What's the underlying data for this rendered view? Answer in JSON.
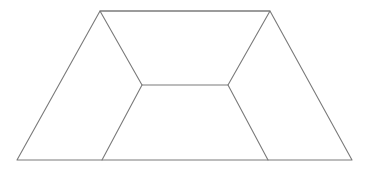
{
  "canvas": {
    "width": 367,
    "height": 171,
    "background_color": "#ffffff",
    "title": "Line drawing of a trapezoid partitioned into three regions"
  },
  "style": {
    "stroke_color": "#7a7a7a",
    "stroke_width": 1.1,
    "fill_color": "none"
  },
  "chart_data": {
    "type": "diagram",
    "grid": false,
    "legend": false,
    "xlim": [
      0,
      367
    ],
    "ylim": [
      0,
      171
    ],
    "points": {
      "outer_top_left": [
        100,
        11
      ],
      "outer_top_right": [
        270,
        11
      ],
      "outer_bottom_right": [
        352,
        160
      ],
      "outer_bottom_left": [
        17,
        160
      ],
      "inner_top_left": [
        142,
        85
      ],
      "inner_top_right": [
        228,
        85
      ],
      "inner_bottom_left": [
        102,
        160
      ],
      "inner_bottom_right": [
        268,
        160
      ]
    },
    "shapes": [
      {
        "name": "outer-trapezoid",
        "kind": "polygon",
        "closed": true,
        "vertices": [
          [
            100,
            11
          ],
          [
            270,
            11
          ],
          [
            352,
            160
          ],
          [
            17,
            160
          ]
        ]
      },
      {
        "name": "inner-trapezoid",
        "kind": "polygon",
        "closed": true,
        "vertices": [
          [
            100,
            11
          ],
          [
            270,
            11
          ],
          [
            228,
            85
          ],
          [
            142,
            85
          ]
        ]
      },
      {
        "name": "left-divider-segment",
        "kind": "line",
        "closed": false,
        "vertices": [
          [
            142,
            85
          ],
          [
            102,
            160
          ]
        ]
      },
      {
        "name": "right-divider-segment",
        "kind": "line",
        "closed": false,
        "vertices": [
          [
            228,
            85
          ],
          [
            268,
            160
          ]
        ]
      }
    ],
    "regions": [
      {
        "name": "left-region",
        "vertices": [
          [
            100,
            11
          ],
          [
            142,
            85
          ],
          [
            102,
            160
          ],
          [
            17,
            160
          ]
        ]
      },
      {
        "name": "center-region",
        "vertices": [
          [
            142,
            85
          ],
          [
            228,
            85
          ],
          [
            268,
            160
          ],
          [
            102,
            160
          ]
        ]
      },
      {
        "name": "right-region",
        "vertices": [
          [
            270,
            11
          ],
          [
            352,
            160
          ],
          [
            268,
            160
          ],
          [
            228,
            85
          ]
        ]
      }
    ],
    "edges": [
      {
        "name": "top-edge",
        "from": [
          100,
          11
        ],
        "to": [
          270,
          11
        ]
      },
      {
        "name": "bottom-edge",
        "from": [
          17,
          160
        ],
        "to": [
          352,
          160
        ]
      },
      {
        "name": "left-outer-edge",
        "from": [
          100,
          11
        ],
        "to": [
          17,
          160
        ]
      },
      {
        "name": "right-outer-edge",
        "from": [
          270,
          11
        ],
        "to": [
          352,
          160
        ]
      },
      {
        "name": "inner-left-edge",
        "from": [
          100,
          11
        ],
        "to": [
          142,
          85
        ]
      },
      {
        "name": "inner-right-edge",
        "from": [
          270,
          11
        ],
        "to": [
          228,
          85
        ]
      },
      {
        "name": "inner-bottom-edge",
        "from": [
          142,
          85
        ],
        "to": [
          228,
          85
        ]
      },
      {
        "name": "left-divider-edge",
        "from": [
          142,
          85
        ],
        "to": [
          102,
          160
        ]
      },
      {
        "name": "right-divider-edge",
        "from": [
          228,
          85
        ],
        "to": [
          268,
          160
        ]
      }
    ]
  }
}
